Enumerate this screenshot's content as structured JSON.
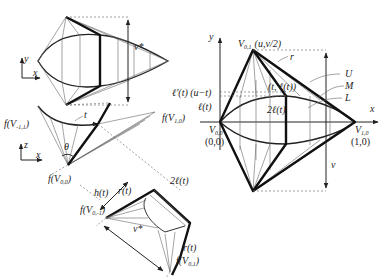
{
  "figure": {
    "type": "geometric construction diagram",
    "panels": {
      "top_left": {
        "axis_labels": {
          "y": "y",
          "x": "x"
        },
        "dimension_label": "v*"
      },
      "middle_left": {
        "axis_labels": {
          "z": "z",
          "x": "x"
        },
        "labels": {
          "f_v_minus1_1": "f(V",
          "f_v_minus1_1_sub": "-1,1",
          "f_v_1_0": "f(V",
          "f_v_1_0_sub": "1,0",
          "f_v_0_0": "f(V",
          "f_v_0_0_sub": "0,0",
          "t": "t",
          "theta": "θ"
        }
      },
      "bottom_left": {
        "labels": {
          "h_t": "h(t)",
          "r_t_top": "r(t)",
          "two_l_t": "2ℓ(t)",
          "r_t_side": "r(t)",
          "f_v_0_minus1": "f(V",
          "f_v_0_minus1_sub": "0,-1",
          "f_v_0_1": "f(V",
          "f_v_0_1_sub": "0,1",
          "v_star": "v*"
        }
      },
      "right": {
        "axis_labels": {
          "y": "y",
          "x": "x"
        },
        "labels": {
          "v01": "V",
          "v01_sub": "0,1",
          "v01_coord": "(u,v/2)",
          "r": "r",
          "U": "U",
          "M": "M",
          "L": "L",
          "point_t": "(t, ℓ(t))",
          "lprime": "ℓ'(t) (u−t)",
          "l_t": "ℓ(t)",
          "two_l_t": "2ℓ(t)",
          "v00": "V",
          "v00_sub": "0,0",
          "v00_coord": "(0,0)",
          "v10": "V",
          "v10_sub": "1,0",
          "v10_coord": "(1,0)",
          "v": "v"
        }
      }
    }
  }
}
